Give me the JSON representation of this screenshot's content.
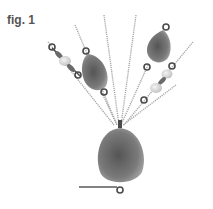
{
  "figure": {
    "label": "fig. 1",
    "colors": {
      "drop_bead": "#6f6f6f",
      "drop_bead_highlight": "#9a9a9a",
      "pearl": "#d9d9d9",
      "chain": "#a8a8a8",
      "jump_ring": "#4a4a4a"
    },
    "components": [
      "large-drop-bead",
      "small-drop-bead-left",
      "small-drop-bead-right",
      "pearl-link-left",
      "pearl-link-right",
      "chains",
      "ear-wire"
    ]
  }
}
